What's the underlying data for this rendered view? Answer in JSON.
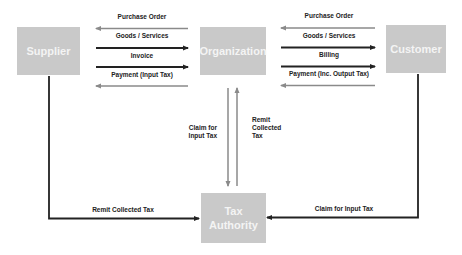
{
  "colors": {
    "box_fill": "#c9c9c9",
    "box_text": "#f4f4f4",
    "arrow_dark": "#222222",
    "arrow_light": "#8a8a8a",
    "label_text": "#222222"
  },
  "nodes": {
    "supplier": "Supplier",
    "organization": "Organization",
    "customer": "Customer",
    "tax_authority_line1": "Tax",
    "tax_authority_line2": "Authority"
  },
  "supplier_org_flows": [
    {
      "label": "Purchase Order",
      "direction": "org-to-supplier"
    },
    {
      "label": "Goods / Services",
      "direction": "supplier-to-org"
    },
    {
      "label": "Invoice",
      "direction": "supplier-to-org"
    },
    {
      "label": "Payment (Input Tax)",
      "direction": "org-to-supplier"
    }
  ],
  "org_customer_flows": [
    {
      "label": "Purchase Order",
      "direction": "customer-to-org"
    },
    {
      "label": "Goods / Services",
      "direction": "org-to-customer"
    },
    {
      "label": "Billing",
      "direction": "org-to-customer"
    },
    {
      "label": "Payment (Inc. Output Tax)",
      "direction": "customer-to-org"
    }
  ],
  "org_tax_flows": {
    "claim_line1": "Claim for",
    "claim_line2": "Input  Tax",
    "remit_line1": "Remit",
    "remit_line2": "Collected",
    "remit_line3": "Tax"
  },
  "supplier_tax_flow": "Remit  Collected Tax",
  "customer_tax_flow": "Claim for  Input  Tax"
}
